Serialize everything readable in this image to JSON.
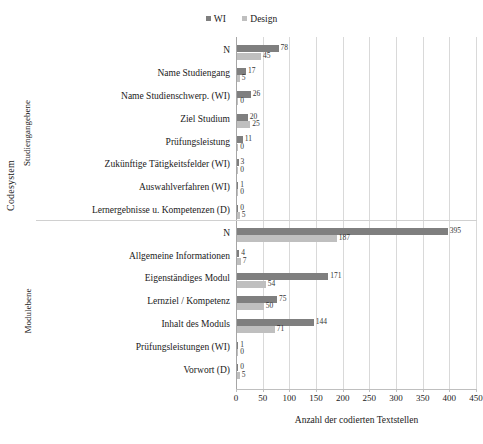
{
  "chart_data": {
    "type": "bar",
    "orientation": "horizontal",
    "title": "",
    "xlabel": "Anzahl der codierten Textstellen",
    "ylabel": "Codesystem",
    "xlim": [
      0,
      450
    ],
    "xticks": [
      0,
      50,
      100,
      150,
      200,
      250,
      300,
      350,
      400,
      450
    ],
    "grid": true,
    "legend_position": "top-center",
    "legend": [
      "WI",
      "Design"
    ],
    "colors": {
      "WI": "#7f7f7f",
      "Design": "#bfbfbf"
    },
    "groups": [
      {
        "name": "Studiengangebene",
        "categories": [
          "N",
          "Name Studiengang",
          "Name Studienschwerp. (WI)",
          "Ziel Studium",
          "Prüfungsleistung",
          "Zukünftige Tätigkeitsfelder (WI)",
          "Auswahlverfahren (WI)",
          "Lernergebnisse u. Kompetenzen (D)"
        ],
        "series": [
          {
            "name": "WI",
            "values": [
              78,
              17,
              26,
              20,
              11,
              3,
              1,
              0
            ]
          },
          {
            "name": "Design",
            "values": [
              45,
              5,
              0,
              25,
              0,
              0,
              0,
              5
            ]
          }
        ]
      },
      {
        "name": "Modulebene",
        "categories": [
          "N",
          "Allgemeine Informationen",
          "Eigenständiges Modul",
          "Lernziel / Kompetenz",
          "Inhalt des Moduls",
          "Prüfungsleistungen (WI)",
          "Vorwort (D)"
        ],
        "series": [
          {
            "name": "WI",
            "values": [
              395,
              4,
              171,
              75,
              144,
              1,
              0
            ]
          },
          {
            "name": "Design",
            "values": [
              187,
              7,
              54,
              50,
              71,
              0,
              5
            ]
          }
        ]
      }
    ]
  },
  "axes": {
    "y_title": "Codesystem",
    "x_title": "Anzahl der codierten Textstellen",
    "x_tick_labels": [
      "0",
      "50",
      "100",
      "150",
      "200",
      "250",
      "300",
      "350",
      "400",
      "450"
    ]
  },
  "legend": {
    "items": [
      {
        "label": "WI",
        "color": "#7f7f7f"
      },
      {
        "label": "Design",
        "color": "#bfbfbf"
      }
    ]
  },
  "groups": [
    {
      "label": "Studiengangebene"
    },
    {
      "label": "Modulebene"
    }
  ],
  "caption": ""
}
